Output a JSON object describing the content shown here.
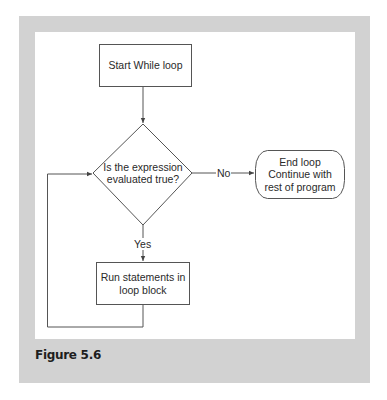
{
  "figure": {
    "caption": "Figure 5.6",
    "frame_color": "#d2d2d2",
    "panel_color": "#ffffff",
    "line_color": "#555555"
  },
  "nodes": {
    "start": {
      "shape": "rectangle",
      "label": "Start While loop"
    },
    "condition": {
      "shape": "diamond",
      "label": "Is the expression\nevaluated true?"
    },
    "body": {
      "shape": "rectangle",
      "label": "Run statements in\nloop block"
    },
    "end": {
      "shape": "rounded-rectangle",
      "label": "End loop\nContinue with\nrest of program"
    }
  },
  "edges": {
    "start_to_condition": {
      "from": "start",
      "to": "condition",
      "label": ""
    },
    "condition_yes": {
      "from": "condition",
      "to": "body",
      "label": "Yes"
    },
    "condition_no": {
      "from": "condition",
      "to": "end",
      "label": "No"
    },
    "body_loop_back": {
      "from": "body",
      "to": "condition",
      "label": ""
    }
  }
}
